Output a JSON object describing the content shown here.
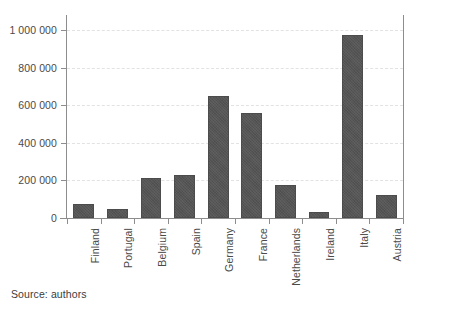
{
  "chart_data": {
    "type": "bar",
    "title": "",
    "subtitle": "",
    "xlabel": "",
    "ylabel": "",
    "categories": [
      "Finland",
      "Portugal",
      "Belgium",
      "Spain",
      "Germany",
      "France",
      "Netherlands",
      "Ireland",
      "Italy",
      "Austria"
    ],
    "values": [
      75000,
      50000,
      215000,
      230000,
      650000,
      560000,
      175000,
      30000,
      975000,
      125000
    ],
    "series": [
      {
        "name": "",
        "values": [
          75000,
          50000,
          215000,
          230000,
          650000,
          560000,
          175000,
          30000,
          975000,
          125000
        ]
      }
    ],
    "ylim": [
      0,
      1080000
    ],
    "yticks": [
      0,
      200000,
      400000,
      600000,
      800000,
      1000000
    ],
    "ytick_labels": [
      "0",
      "200 000",
      "400 000",
      "600 000",
      "800 000",
      "1 000 000"
    ],
    "grid": true,
    "grid_axis": "y",
    "grid_style": "dashed",
    "legend": false,
    "legend_position": "none",
    "bar_color": "#555555",
    "grid_color": "#e2e2e2",
    "axis_color": "#8d8d8d",
    "annotations": [
      "Source: authors"
    ]
  },
  "footer": {
    "source_note": "Source: authors"
  }
}
